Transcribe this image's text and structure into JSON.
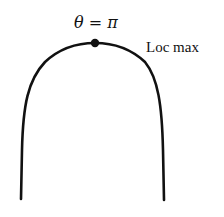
{
  "diagram": {
    "type": "curve-with-labeled-point",
    "curve": "inverted U-shape (local maximum at top)",
    "point_label": "θ = π",
    "annotation": "Loc max",
    "colors": {
      "stroke": "#111111",
      "background": "#ffffff"
    }
  }
}
